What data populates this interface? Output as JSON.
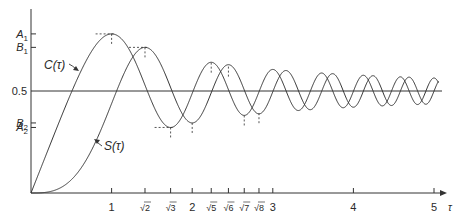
{
  "chart_data": {
    "type": "line",
    "title": "",
    "xlabel": "τ",
    "ylabel": "",
    "xlim": [
      0,
      5.05
    ],
    "ylim": [
      0,
      0.9
    ],
    "grid": false,
    "legend": "none",
    "series": [
      {
        "name": "C(τ)",
        "function": "Fresnel cosine integral C(τ) = ∫₀^τ cos(πt²/2) dt",
        "label": "C(τ)"
      },
      {
        "name": "S(τ)",
        "function": "Fresnel sine integral S(τ) = ∫₀^τ sin(πt²/2) dt",
        "label": "S(τ)"
      }
    ],
    "x_ticks": [
      {
        "value": 1,
        "label": "1"
      },
      {
        "value": 1.41421,
        "label": "√2"
      },
      {
        "value": 1.73205,
        "label": "√3"
      },
      {
        "value": 2,
        "label": "2"
      },
      {
        "value": 2.23607,
        "label": "√5"
      },
      {
        "value": 2.44949,
        "label": "√6"
      },
      {
        "value": 2.64575,
        "label": "√7"
      },
      {
        "value": 2.82843,
        "label": "√8"
      },
      {
        "value": 3,
        "label": "3"
      },
      {
        "value": 4,
        "label": "4"
      },
      {
        "value": 5,
        "label": "5"
      }
    ],
    "y_ticks": [
      {
        "value": 0.7799,
        "label": "A₁",
        "base": "A",
        "sub": "1"
      },
      {
        "value": 0.7139,
        "label": "B₁",
        "base": "B",
        "sub": "1"
      },
      {
        "value": 0.5,
        "label": "0.5"
      },
      {
        "value": 0.3434,
        "label": "B₂",
        "base": "B",
        "sub": "2"
      },
      {
        "value": 0.3213,
        "label": "A₂",
        "base": "A",
        "sub": "2"
      }
    ],
    "reference_line": {
      "y": 0.5
    },
    "extrema_markers": [
      {
        "x": 1,
        "y": 0.7799,
        "horizontal": true
      },
      {
        "x": 1.41421,
        "y": 0.7139,
        "horizontal": true
      },
      {
        "x": 1.73205,
        "y": 0.3213,
        "horizontal": true
      },
      {
        "x": 2,
        "y": 0.3434,
        "horizontal": false
      },
      {
        "x": 2.23607,
        "y": 0.6389,
        "horizontal": false
      },
      {
        "x": 2.44949,
        "y": 0.6195,
        "horizontal": false
      },
      {
        "x": 2.64575,
        "y": 0.3801,
        "horizontal": false
      },
      {
        "x": 2.82843,
        "y": 0.3913,
        "horizontal": false
      }
    ],
    "annotations": [
      {
        "text": "C(τ)",
        "target_series": "C(τ)"
      },
      {
        "text": "S(τ)",
        "target_series": "S(τ)"
      }
    ],
    "x_axis_label": "τ"
  }
}
